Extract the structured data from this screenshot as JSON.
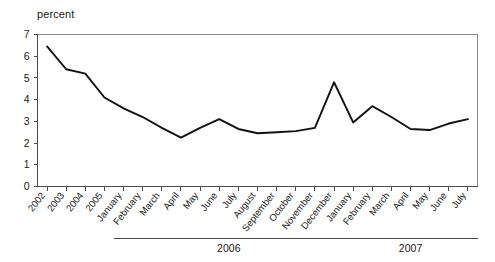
{
  "chart_data": {
    "type": "line",
    "title": "",
    "ylabel": "percent",
    "xlabel": "",
    "ylim": [
      0,
      7
    ],
    "yticks": [
      0,
      1,
      2,
      3,
      4,
      5,
      6,
      7
    ],
    "grid": false,
    "legend": "none",
    "categories": [
      "2002",
      "2003",
      "2004",
      "2005",
      "January",
      "February",
      "March",
      "April",
      "May",
      "June",
      "July",
      "August",
      "September",
      "October",
      "November",
      "December",
      "January",
      "February",
      "March",
      "April",
      "May",
      "June",
      "July"
    ],
    "values": [
      6.45,
      5.4,
      5.2,
      4.1,
      3.6,
      3.2,
      2.7,
      2.25,
      2.7,
      3.1,
      2.65,
      2.45,
      2.5,
      2.55,
      2.7,
      4.8,
      2.95,
      3.7,
      3.2,
      2.65,
      2.6,
      2.9,
      3.1
    ],
    "group_labels": [
      {
        "label": "2006",
        "start_index": 4,
        "end_index": 15
      },
      {
        "label": "2007",
        "start_index": 16,
        "end_index": 22
      }
    ],
    "series": [
      {
        "name": "percent",
        "color": "#111111",
        "values": [
          6.45,
          5.4,
          5.2,
          4.1,
          3.6,
          3.2,
          2.7,
          2.25,
          2.7,
          3.1,
          2.65,
          2.45,
          2.5,
          2.55,
          2.7,
          4.8,
          2.95,
          3.7,
          3.2,
          2.65,
          2.6,
          2.9,
          3.1
        ]
      }
    ]
  },
  "colors": {
    "series": "#111111",
    "axis": "#4a4a4a",
    "frame": "#8a8a8a",
    "text": "#1a1a1a",
    "background": "#ffffff"
  }
}
